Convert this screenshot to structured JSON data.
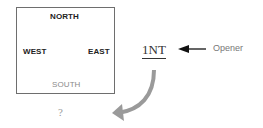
{
  "diagram": {
    "seats": {
      "north": "NORTH",
      "west": "WEST",
      "east": "EAST",
      "south": "SOUTH"
    },
    "south_response": "?",
    "bid": "1NT",
    "opener_label": "Opener",
    "colors": {
      "box_border": "#6e6e6e",
      "curved_arrow": "#9a9a9a",
      "pointer_arrow": "#111111",
      "south_text": "#8a8a8a"
    }
  }
}
